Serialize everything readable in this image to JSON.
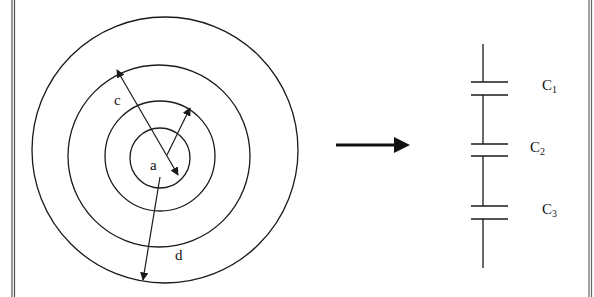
{
  "figure": {
    "stroke_color": "#1a1a1a",
    "background": "#ffffff",
    "border_color": "#444444"
  },
  "left_panel": {
    "description": "Concentric spherical shells (cross-section)",
    "circles": [
      {
        "name": "outer-shell",
        "cx": 165,
        "cy": 150,
        "r": 133
      },
      {
        "name": "second-shell",
        "cx": 159,
        "cy": 156,
        "r": 91
      },
      {
        "name": "third-shell",
        "cx": 160,
        "cy": 156,
        "r": 55
      },
      {
        "name": "inner-shell",
        "cx": 160,
        "cy": 158,
        "r": 30
      }
    ],
    "labels": {
      "a": "a",
      "c": "c",
      "d": "d"
    }
  },
  "transform_arrow": {
    "direction": "right"
  },
  "right_panel": {
    "description": "Equivalent series capacitor circuit",
    "capacitors": [
      {
        "name": "C",
        "subscript": "1"
      },
      {
        "name": "C",
        "subscript": "2"
      },
      {
        "name": "C",
        "subscript": "3"
      }
    ]
  }
}
